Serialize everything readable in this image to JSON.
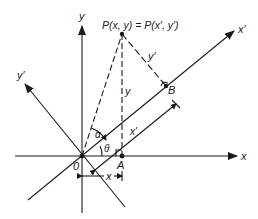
{
  "diagram": {
    "labels": {
      "y_axis": "y",
      "x_axis": "x",
      "x_prime_axis": "x′",
      "y_prime_axis": "y′",
      "point_P": "P(x, y) = P(x′, y′)",
      "origin": "0",
      "point_A": "A",
      "point_B": "B",
      "seg_y": "y",
      "seg_y_prime": "y′",
      "seg_x_prime": "x′",
      "seg_x": "x",
      "angle_alpha": "α",
      "angle_theta": "θ"
    },
    "colors": {
      "ink": "#1a1a1a",
      "background": "#ffffff"
    }
  }
}
